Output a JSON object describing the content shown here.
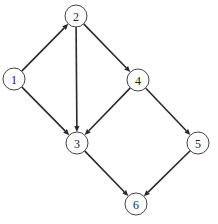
{
  "diagram": {
    "type": "directed-graph",
    "node_radius": 11,
    "colors": {
      "stroke": "#444444",
      "edge": "#2a2a2a",
      "fill": "#ffffff",
      "text": "#222222"
    },
    "nodes": [
      {
        "id": "1",
        "label": "1",
        "x": 14,
        "y": 79
      },
      {
        "id": "2",
        "label": "2",
        "x": 76,
        "y": 16
      },
      {
        "id": "3",
        "label": "3",
        "x": 77,
        "y": 143
      },
      {
        "id": "4",
        "label": "4",
        "x": 138,
        "y": 80
      },
      {
        "id": "5",
        "label": "5",
        "x": 198,
        "y": 143
      },
      {
        "id": "6",
        "label": "6",
        "x": 136,
        "y": 204
      }
    ],
    "edges": [
      {
        "from": "1",
        "to": "2"
      },
      {
        "from": "1",
        "to": "3"
      },
      {
        "from": "2",
        "to": "3"
      },
      {
        "from": "2",
        "to": "4"
      },
      {
        "from": "4",
        "to": "3"
      },
      {
        "from": "4",
        "to": "5"
      },
      {
        "from": "3",
        "to": "6"
      },
      {
        "from": "5",
        "to": "6"
      }
    ]
  }
}
